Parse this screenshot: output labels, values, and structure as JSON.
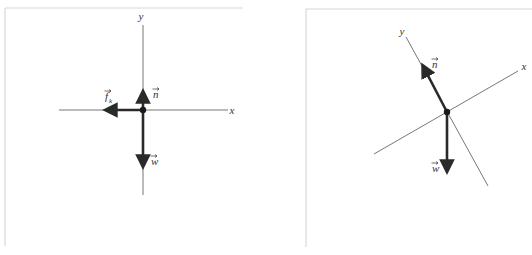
{
  "colors": {
    "frame": "#d8d8d8",
    "axis": "#777777",
    "vector": "#2a2a2a",
    "label": "#333333"
  },
  "diagrams": [
    {
      "id": "left",
      "frame": {
        "x": 5,
        "y": 8,
        "w": 238,
        "h": 238
      },
      "origin": [
        143,
        110
      ],
      "axes": {
        "x": {
          "label": "x",
          "from": [
            59,
            110
          ],
          "to": [
            228,
            110
          ],
          "label_pos": [
            232,
            114
          ]
        },
        "y": {
          "label": "y",
          "from": [
            143,
            195
          ],
          "to": [
            143,
            25
          ],
          "label_pos": [
            141,
            20
          ]
        }
      },
      "vectors": [
        {
          "name": "n",
          "label": "n",
          "to": [
            143,
            92
          ],
          "label_pos": [
            153,
            98
          ],
          "vector_arrow": true
        },
        {
          "name": "w",
          "label": "w",
          "to": [
            143,
            166
          ],
          "label_pos": [
            151,
            165
          ],
          "vector_arrow": true
        },
        {
          "name": "f_k",
          "label": "f",
          "subscript": "k",
          "to": [
            106,
            110
          ],
          "label_pos": [
            105,
            100
          ],
          "vector_arrow": true
        }
      ]
    },
    {
      "id": "right",
      "frame": {
        "x": 306,
        "y": 9,
        "w": 226,
        "h": 238
      },
      "origin": [
        447,
        112
      ],
      "axes": {
        "x": {
          "label": "x",
          "from": [
            374,
            154
          ],
          "to": [
            518,
            71
          ],
          "label_pos": [
            524,
            70
          ]
        },
        "y": {
          "label": "y",
          "from": [
            488,
            186
          ],
          "to": [
            406,
            37
          ],
          "label_pos": [
            402,
            35
          ]
        }
      },
      "vectors": [
        {
          "name": "n",
          "label": "n",
          "to": [
            423,
            66
          ],
          "label_pos": [
            432,
            68
          ],
          "vector_arrow": true
        },
        {
          "name": "w",
          "label": "w",
          "to": [
            447,
            171
          ],
          "label_pos": [
            432,
            172
          ],
          "vector_arrow": true
        }
      ]
    }
  ]
}
